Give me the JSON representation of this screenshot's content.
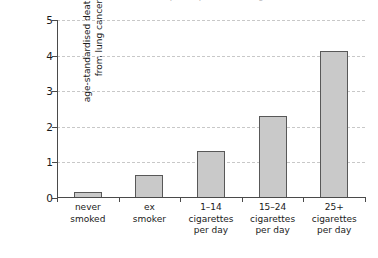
{
  "figure": {
    "clipped_caption": "smoked a clear dose-response pattern of lung cancer risk",
    "background_color": "#ffffff"
  },
  "chart_data": {
    "type": "bar",
    "title": "",
    "xlabel": "",
    "ylabel": "age-standardised death rate from lung cancer",
    "ylabel_lines": [
      "age-standardised death rate",
      "from lung cancer"
    ],
    "categories": [
      "never smoked",
      "ex smoker",
      "1–14 cigarettes per day",
      "15–24 cigarettes per day",
      "25+ cigarettes per day"
    ],
    "category_lines": [
      [
        "never",
        "smoked"
      ],
      [
        "ex",
        "smoker"
      ],
      [
        "1–14",
        "cigarettes",
        "per day"
      ],
      [
        "15–24",
        "cigarettes",
        "per day"
      ],
      [
        "25+",
        "cigarettes",
        "per day"
      ]
    ],
    "values": [
      0.17,
      0.65,
      1.31,
      2.29,
      4.14
    ],
    "ylim": [
      0,
      5
    ],
    "yticks": [
      0,
      1,
      2,
      3,
      4,
      5
    ],
    "ytick_labels": [
      "0",
      "1",
      "2",
      "3",
      "4",
      "5"
    ],
    "grid": true,
    "grid_axis": "y",
    "grid_style": "dashed",
    "legend": "none",
    "bar_fill_color": "#c9c9c9",
    "bar_edge_color": "#585858",
    "grid_color": "#c8c8c8",
    "axis_color": "#4a4a4a"
  }
}
